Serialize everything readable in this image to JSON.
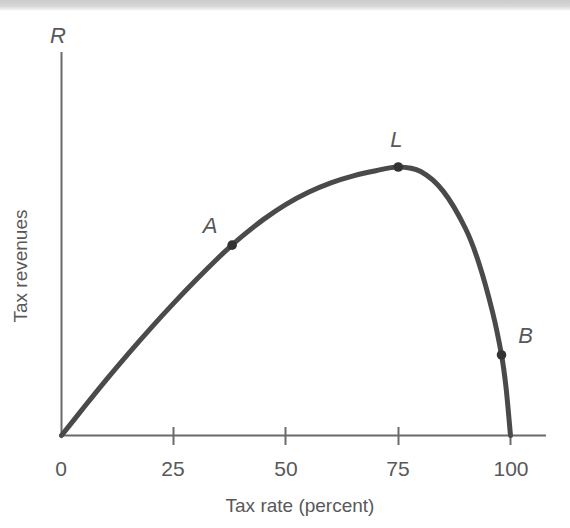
{
  "figure": {
    "name": "laffer-curve",
    "background_color": "#ffffff",
    "ink_color": "#4a4a4a",
    "text_color": "#58585a",
    "scan_band": {
      "label": "scanned-page-edge-band",
      "color": "#cccccc"
    }
  },
  "chart_data": {
    "type": "line",
    "title": "",
    "xlabel": "Tax rate (percent)",
    "ylabel": "Tax revenues",
    "x_axis_symbol": "",
    "y_axis_symbol": "R",
    "xlim": [
      0,
      108
    ],
    "ylim": [
      0,
      1.18
    ],
    "grid": false,
    "legend": null,
    "xticks": [
      0,
      25,
      50,
      75,
      100
    ],
    "xtick_labels": [
      "0",
      "25",
      "50",
      "75",
      "100"
    ],
    "yticks": [],
    "ytick_labels": [],
    "series": [
      {
        "name": "Laffer curve",
        "color": "#4a4a4a",
        "x": [
          0,
          5,
          10,
          15,
          20,
          25,
          30,
          35,
          38,
          40,
          45,
          50,
          55,
          60,
          65,
          70,
          75,
          80,
          85,
          90,
          93,
          96,
          98,
          99,
          100
        ],
        "y": [
          0,
          0.105,
          0.208,
          0.307,
          0.402,
          0.493,
          0.58,
          0.663,
          0.709,
          0.739,
          0.805,
          0.861,
          0.906,
          0.941,
          0.967,
          0.986,
          1.0,
          0.983,
          0.91,
          0.77,
          0.64,
          0.46,
          0.3,
          0.18,
          0.0
        ]
      }
    ],
    "annotations": [
      {
        "label": "A",
        "x": 38,
        "y": 0.709,
        "label_dx": -22,
        "label_dy": -12,
        "marker": "dot"
      },
      {
        "label": "L",
        "x": 75,
        "y": 1.0,
        "label_dx": -2,
        "label_dy": -20,
        "marker": "dot"
      },
      {
        "label": "B",
        "x": 98,
        "y": 0.3,
        "label_dx": 24,
        "label_dy": -12,
        "marker": "dot"
      }
    ]
  }
}
